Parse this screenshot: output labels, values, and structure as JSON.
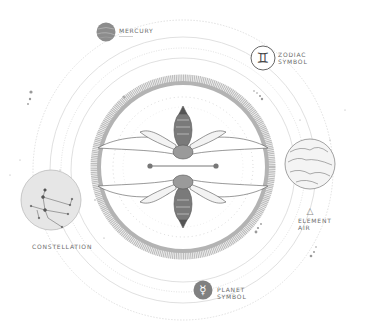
{
  "labels": {
    "mercury": "MERCURY",
    "zodiac_line1": "ZODIAC",
    "zodiac_line2": "SYMBOL",
    "constellation": "CONSTELLATION",
    "element_line1": "ELEMENT",
    "element_line2": "AIR",
    "planet_line1": "PLANET",
    "planet_line2": "SYMBOL"
  },
  "symbols": {
    "zodiac_glyph": "♊",
    "planet_glyph": "☿",
    "element_glyph": "△"
  },
  "colors": {
    "ink": "#555555",
    "gray_fill": "#8a8a8a",
    "ring": "#b9b9b9",
    "orbit": "#d6d6d6",
    "circle_bg": "#e6e6e6",
    "text": "#6b6b6b"
  }
}
